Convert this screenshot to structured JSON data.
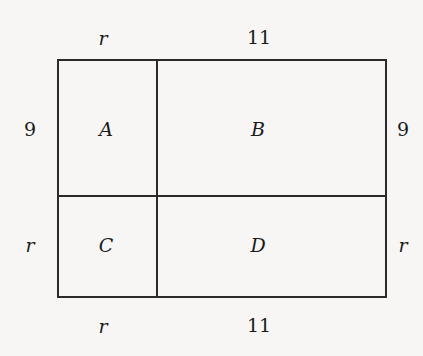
{
  "diagram": {
    "type": "partitioned-rectangle",
    "top_labels": {
      "left": "r",
      "right": "11"
    },
    "bottom_labels": {
      "left": "r",
      "right": "11"
    },
    "left_labels": {
      "top": "9",
      "bottom": "r"
    },
    "right_labels": {
      "top": "9",
      "bottom": "r"
    },
    "regions": {
      "top_left": "A",
      "top_right": "B",
      "bottom_left": "C",
      "bottom_right": "D"
    },
    "line_color": "#2a2a2a",
    "background": "#f7f6f4"
  }
}
